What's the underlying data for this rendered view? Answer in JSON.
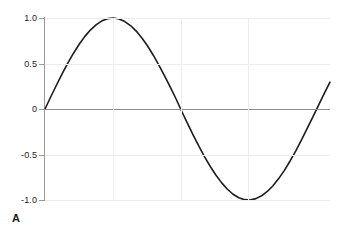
{
  "figure": {
    "panel_label": "A",
    "background_color": "#ffffff"
  },
  "chart_data": {
    "type": "line",
    "title": "",
    "subtitle": "",
    "xlabel": "",
    "ylabel": "",
    "xlim": [
      0,
      6.6
    ],
    "ylim": [
      -1.0,
      1.0
    ],
    "grid": true,
    "legend": null,
    "legend_position": "none",
    "line_color": "#1c1c1c",
    "line_width": 1.6,
    "axis_color": "#9a9a9a",
    "gridline_color": "#ededed",
    "zero_line_color": "#8e8e8e",
    "x_tick_labels": [],
    "y_ticks": [
      {
        "value": 1.0,
        "label": "1.0"
      },
      {
        "value": 0.5,
        "label": "0.5"
      },
      {
        "value": 0.0,
        "label": "0"
      },
      {
        "value": -0.5,
        "label": "-0.5"
      },
      {
        "value": -1.0,
        "label": "-1.0"
      }
    ],
    "x_gridlines": [
      1.57,
      3.14,
      4.71
    ],
    "series": [
      {
        "name": "sine",
        "x": [
          0.0,
          0.132,
          0.264,
          0.396,
          0.528,
          0.66,
          0.792,
          0.924,
          1.056,
          1.188,
          1.32,
          1.452,
          1.584,
          1.716,
          1.848,
          1.98,
          2.112,
          2.244,
          2.376,
          2.508,
          2.64,
          2.772,
          2.904,
          3.036,
          3.168,
          3.3,
          3.432,
          3.564,
          3.696,
          3.828,
          3.96,
          4.092,
          4.224,
          4.356,
          4.488,
          4.62,
          4.752,
          4.884,
          5.016,
          5.148,
          5.28,
          5.412,
          5.544,
          5.676,
          5.808,
          5.94,
          6.072,
          6.204,
          6.336,
          6.468,
          6.6
        ],
        "y": [
          0.0,
          0.132,
          0.261,
          0.386,
          0.504,
          0.613,
          0.712,
          0.798,
          0.87,
          0.928,
          0.969,
          0.993,
          1.0,
          0.989,
          0.961,
          0.917,
          0.856,
          0.781,
          0.692,
          0.591,
          0.48,
          0.362,
          0.238,
          0.11,
          -0.027,
          -0.158,
          -0.286,
          -0.409,
          -0.525,
          -0.632,
          -0.728,
          -0.812,
          -0.882,
          -0.937,
          -0.975,
          -0.996,
          -1.0,
          -0.985,
          -0.954,
          -0.906,
          -0.843,
          -0.765,
          -0.674,
          -0.571,
          -0.459,
          -0.339,
          -0.214,
          -0.086,
          0.043,
          0.171,
          0.295
        ]
      }
    ]
  }
}
